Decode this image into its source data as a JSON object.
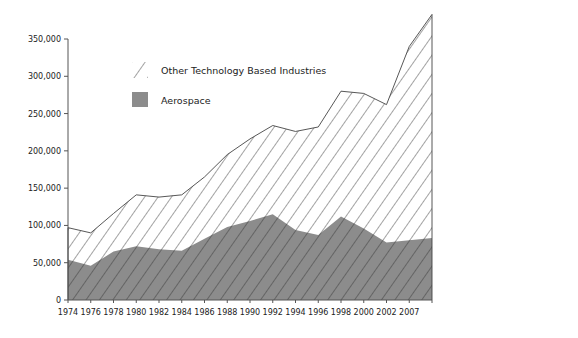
{
  "chart_data": {
    "type": "area",
    "stacked": true,
    "title": "",
    "xlabel": "",
    "ylabel": "",
    "ylim": [
      0,
      350000
    ],
    "y_ticks": [
      0,
      50000,
      100000,
      150000,
      200000,
      250000,
      300000,
      350000
    ],
    "y_tick_labels": [
      "0",
      "50,000",
      "100,000",
      "150,000",
      "200,000",
      "250,000",
      "300,000",
      "350,000"
    ],
    "categories": [
      "1974",
      "1976",
      "1978",
      "1980",
      "1982",
      "1984",
      "1986",
      "1988",
      "1990",
      "1992",
      "1994",
      "1996",
      "1998",
      "2000",
      "2002",
      "2007",
      ""
    ],
    "x_tick_labels": [
      "1974",
      "1976",
      "1978",
      "1980",
      "1982",
      "1984",
      "1986",
      "1988",
      "1990",
      "1992",
      "1994",
      "1996",
      "1998",
      "2000",
      "2002",
      "2007"
    ],
    "series": [
      {
        "name": "Aerospace",
        "fill": "solid",
        "color": "#8c8c8c",
        "values": [
          54000,
          46000,
          65000,
          72000,
          68000,
          66000,
          82000,
          98000,
          106000,
          115000,
          94000,
          87000,
          112000,
          96000,
          77000,
          80000,
          83000
        ]
      },
      {
        "name": "Other Technology Based Industries",
        "fill": "hatched",
        "color": "#444444",
        "totals": [
          97000,
          90000,
          116000,
          141000,
          138000,
          141000,
          165000,
          195000,
          216000,
          234000,
          226000,
          232000,
          280000,
          277000,
          262000,
          340000,
          383000
        ],
        "values": [
          43000,
          44000,
          51000,
          69000,
          70000,
          75000,
          83000,
          97000,
          110000,
          119000,
          132000,
          145000,
          168000,
          181000,
          185000,
          260000,
          300000
        ]
      }
    ],
    "legend": {
      "position": "upper-left-inside",
      "entries": [
        {
          "label": "Other Technology Based Industries",
          "swatch": "hatched"
        },
        {
          "label": "Aerospace",
          "swatch": "solid-gray"
        }
      ]
    },
    "grid": false
  }
}
